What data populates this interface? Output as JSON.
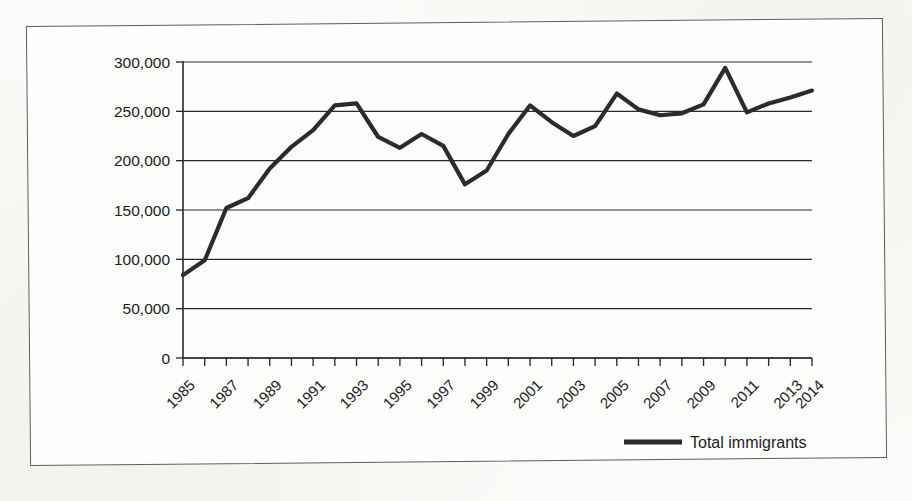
{
  "figure": {
    "background_color": "#fcfcfa",
    "frame_color": "#5d5d5d",
    "line_color": "#2b2b2b",
    "grid_color": "#2a2a2a"
  },
  "legend": {
    "position": "bottom-right",
    "entries": [
      {
        "label": "Total immigrants",
        "color": "#2b2b2b",
        "marker": "line-swatch"
      }
    ]
  },
  "chart_data": {
    "type": "line",
    "title": "",
    "subtitle": "",
    "xlabel": "",
    "ylabel": "",
    "grid": "horizontal",
    "legend_position": "bottom-right",
    "ylim": [
      0,
      300000
    ],
    "yticks": [
      0,
      50000,
      100000,
      150000,
      200000,
      250000,
      300000
    ],
    "ytick_labels": [
      "0",
      "50,000",
      "100,000",
      "150,000",
      "200,000",
      "250,000",
      "300,000"
    ],
    "xlim": [
      "1985",
      "2014"
    ],
    "xticks": [
      "1985",
      "1986",
      "1987",
      "1988",
      "1989",
      "1990",
      "1991",
      "1992",
      "1993",
      "1994",
      "1995",
      "1996",
      "1997",
      "1998",
      "1999",
      "2000",
      "2001",
      "2002",
      "2003",
      "2004",
      "2005",
      "2006",
      "2007",
      "2008",
      "2009",
      "2010",
      "2011",
      "2012",
      "2013",
      "2014"
    ],
    "xtick_labels": [
      "1985",
      "",
      "1987",
      "",
      "1989",
      "",
      "1991",
      "",
      "1993",
      "",
      "1995",
      "",
      "1997",
      "",
      "1999",
      "",
      "2001",
      "",
      "2003",
      "",
      "2005",
      "",
      "2007",
      "",
      "2009",
      "",
      "2011",
      "",
      "2013",
      "2014"
    ],
    "xtick_labels_visible": [
      "1985",
      "1987",
      "1989",
      "1991",
      "1993",
      "1995",
      "1997",
      "1999",
      "2001",
      "2003",
      "2005",
      "2007",
      "2009",
      "2011",
      "2013",
      "2014"
    ],
    "series": [
      {
        "name": "Total immigrants",
        "color": "#2b2b2b",
        "x": [
          "1985",
          "1986",
          "1987",
          "1988",
          "1989",
          "1990",
          "1991",
          "1992",
          "1993",
          "1994",
          "1995",
          "1996",
          "1997",
          "1998",
          "1999",
          "2000",
          "2001",
          "2002",
          "2003",
          "2004",
          "2005",
          "2006",
          "2007",
          "2008",
          "2009",
          "2010",
          "2011",
          "2012",
          "2013",
          "2014"
        ],
        "values": [
          84000,
          99000,
          152000,
          162000,
          192000,
          214000,
          231000,
          256000,
          258000,
          224000,
          213000,
          227000,
          215000,
          176000,
          190000,
          227000,
          256000,
          239000,
          225000,
          235000,
          268000,
          252000,
          246000,
          248000,
          257000,
          294000,
          249000,
          258000,
          264000,
          271000
        ]
      }
    ]
  }
}
